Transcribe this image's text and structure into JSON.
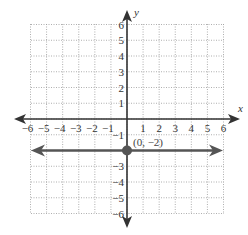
{
  "chart_data": {
    "type": "line",
    "title": "",
    "xlabel": "x",
    "ylabel": "y",
    "xlim": [
      -6,
      6
    ],
    "ylim": [
      -6,
      6
    ],
    "grid": true,
    "grid_style": "dotted",
    "x_ticks": [
      -6,
      -5,
      -4,
      -3,
      -2,
      -1,
      1,
      2,
      3,
      4,
      5,
      6
    ],
    "y_ticks": [
      6,
      5,
      4,
      3,
      2,
      1,
      -1,
      -3,
      -4,
      -5,
      -6
    ],
    "x_tick_labels": [
      "−6",
      "−5",
      "−4",
      "−3",
      "−2",
      "−1",
      "1",
      "2",
      "3",
      "4",
      "5",
      "6"
    ],
    "y_tick_labels": [
      "6",
      "5",
      "4",
      "3",
      "2",
      "1",
      "−1",
      "−3",
      "−4",
      "−5",
      "−6"
    ],
    "series": [
      {
        "name": "y = -2",
        "kind": "horizontal-line",
        "y": -2,
        "x": [
          -6,
          6
        ],
        "values": [
          -2,
          -2
        ],
        "arrows": "both",
        "color": "#555555"
      }
    ],
    "points": [
      {
        "x": 0,
        "y": -2,
        "label": "(0, −2)",
        "color": "#555555"
      }
    ],
    "annotations": [
      "(0, −2)"
    ]
  },
  "labels": {
    "x_axis": "x",
    "y_axis": "y",
    "point": "(0, −2)"
  },
  "colors": {
    "axis": "#333333",
    "line": "#555555",
    "grid": "#999999",
    "point": "#555555"
  }
}
